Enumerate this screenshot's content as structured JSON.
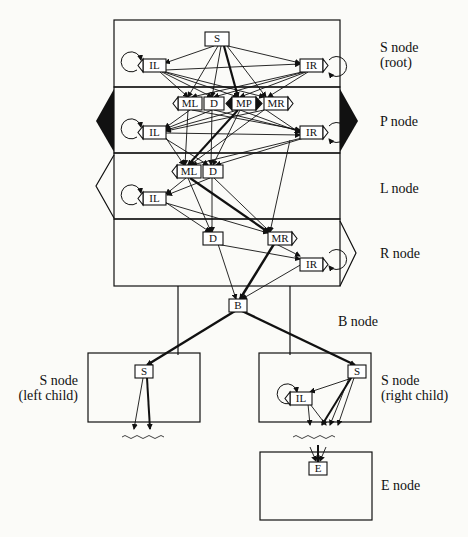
{
  "diagram": {
    "type": "CM node structure / state diagram",
    "node_labels": {
      "s_root": [
        "S node",
        "(root)"
      ],
      "p": [
        "P node"
      ],
      "l": [
        "L node"
      ],
      "r": [
        "R node"
      ],
      "b": [
        "B node"
      ],
      "s_left": [
        "S node",
        "(left child)"
      ],
      "s_right": [
        "S node",
        "(right child)"
      ],
      "e": [
        "E node"
      ]
    },
    "states": {
      "s_root": [
        "S",
        "IL",
        "IR"
      ],
      "p": [
        "ML",
        "D",
        "MP",
        "MR",
        "IL",
        "IR"
      ],
      "l": [
        "ML",
        "D",
        "IL"
      ],
      "r": [
        "D",
        "MR",
        "IR"
      ],
      "b": [
        "B"
      ],
      "s_left": [
        "S"
      ],
      "s_right": [
        "S",
        "IL"
      ],
      "e": [
        "E"
      ]
    },
    "state_text": {
      "S": "S",
      "IL": "IL",
      "IR": "IR",
      "ML": "ML",
      "D": "D",
      "MP": "MP",
      "MR": "MR",
      "B": "B",
      "E": "E"
    },
    "colors": {
      "ink": "#111111",
      "background": "#fbfbf8",
      "box_fill": "#ffffff"
    }
  }
}
